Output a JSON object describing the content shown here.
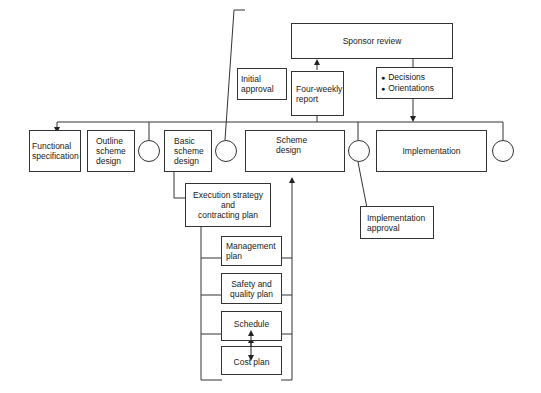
{
  "diagram": {
    "sponsor_review": "Sponsor review",
    "four_weekly_report": "Four-weekly\nreport",
    "decisions_orientations": [
      "Decisions",
      "Orientations"
    ],
    "initial_approval": "Initial approval",
    "stages": {
      "functional_specification": "Functional\nspecification",
      "outline_scheme_design": "Outline\nscheme\ndesign",
      "basic_scheme_design": "Basic\nscheme\ndesign",
      "scheme_design": "Scheme\ndesign",
      "implementation": "Implementation"
    },
    "implementation_approval": "Implementation\napproval",
    "execution_strategy": "Execution strategy\nand\ncontracting plan",
    "plans": {
      "management_plan": "Management\nplan",
      "safety_quality_plan": "Safety and\nquality plan",
      "schedule": "Schedule",
      "cost_plan": "Cost plan"
    }
  }
}
